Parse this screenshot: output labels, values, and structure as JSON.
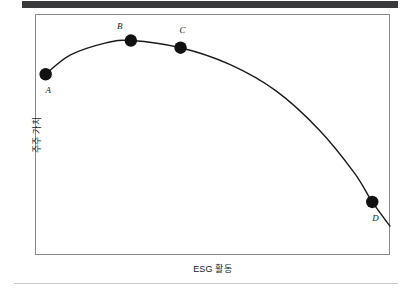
{
  "figure": {
    "background_color": "#ffffff",
    "banner_color": "#3a3a3c",
    "frame_color": "#8a8a8e",
    "rule_color": "#c8c8c8",
    "curve_color": "#1a1a1a",
    "marker_color": "#111111"
  },
  "chart_data": {
    "type": "line",
    "title": "",
    "xlabel": "ESG 활동",
    "ylabel": "주주 가치",
    "grid": false,
    "legend": null,
    "axis_ticks": {
      "x": [],
      "y": []
    },
    "xlim": [
      0,
      100
    ],
    "ylim": [
      0,
      100
    ],
    "series": [
      {
        "name": "주주 가치",
        "x": [
          3,
          10,
          20,
          27,
          41,
          55,
          68,
          80,
          90,
          95,
          100
        ],
        "y": [
          75,
          83,
          88,
          89,
          86,
          79,
          68,
          52,
          34,
          22,
          12
        ]
      }
    ],
    "points": [
      {
        "label": "A",
        "x": 3,
        "y": 75,
        "label_position": "below-left"
      },
      {
        "label": "B",
        "x": 27,
        "y": 89,
        "label_position": "above-left"
      },
      {
        "label": "C",
        "x": 41,
        "y": 86,
        "label_position": "above"
      },
      {
        "label": "D",
        "x": 95,
        "y": 22,
        "label_position": "below-left"
      }
    ]
  }
}
